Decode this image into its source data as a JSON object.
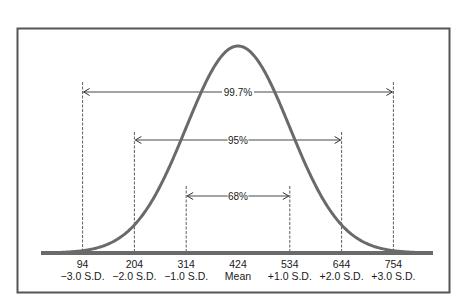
{
  "diagram": {
    "title": "",
    "type": "normal-distribution-empirical-rule",
    "mean": 424,
    "standard_deviation": 110,
    "colors": {
      "frame": "#555555",
      "curve": "#6a6a6a",
      "baseline": "#6a6a6a",
      "guide_lines": "#333333",
      "text": "#1a1a1a"
    },
    "ticks": [
      {
        "value": "94",
        "label": "−3.0 S.D.",
        "sd": -3
      },
      {
        "value": "204",
        "label": "−2.0 S.D.",
        "sd": -2
      },
      {
        "value": "314",
        "label": "−1.0 S.D.",
        "sd": -1
      },
      {
        "value": "424",
        "label": "Mean",
        "sd": 0
      },
      {
        "value": "534",
        "label": "+1.0 S.D.",
        "sd": 1
      },
      {
        "value": "644",
        "label": "+2.0 S.D.",
        "sd": 2
      },
      {
        "value": "754",
        "label": "+3.0 S.D.",
        "sd": 3
      }
    ],
    "intervals": [
      {
        "label": "99.7%",
        "from_sd": -3,
        "to_sd": 3
      },
      {
        "label": "95%",
        "from_sd": -2,
        "to_sd": 2
      },
      {
        "label": "68%",
        "from_sd": -1,
        "to_sd": 1
      }
    ]
  },
  "chart_data": {
    "type": "line",
    "title": "",
    "xlabel": "",
    "ylabel": "",
    "x": [
      94,
      204,
      314,
      424,
      534,
      644,
      754
    ],
    "x_tick_labels": [
      "94\n−3.0 S.D.",
      "204\n−2.0 S.D.",
      "314\n−1.0 S.D.",
      "424\nMean",
      "534\n+1.0 S.D.",
      "644\n+2.0 S.D.",
      "754\n+3.0 S.D."
    ],
    "series": [
      {
        "name": "Normal distribution (mean 424, S.D. 110)",
        "shape": "bell curve"
      }
    ],
    "annotations": [
      {
        "text": "99.7%",
        "span": [
          94,
          754
        ]
      },
      {
        "text": "95%",
        "span": [
          204,
          644
        ]
      },
      {
        "text": "68%",
        "span": [
          314,
          534
        ]
      }
    ],
    "grid": false,
    "legend": "none"
  }
}
